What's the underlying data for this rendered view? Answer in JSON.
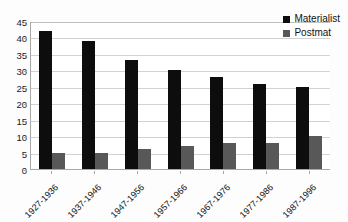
{
  "chart_data": {
    "type": "bar",
    "title": "",
    "xlabel": "",
    "ylabel": "",
    "categories": [
      "1927-1936",
      "1937-1946",
      "1947-1956",
      "1957-1966",
      "1967-1976",
      "1977-1986",
      "1987-1996"
    ],
    "series": [
      {
        "name": "Materialist",
        "color": "#0d0d0d",
        "values": [
          42,
          39,
          33,
          30,
          28,
          26,
          25
        ]
      },
      {
        "name": "Postmat",
        "color": "#585858",
        "values": [
          5,
          5,
          6,
          7,
          8,
          8,
          10
        ]
      }
    ],
    "ylim": [
      0,
      45
    ],
    "ytick_labels": [
      "45",
      "40",
      "35",
      "30",
      "25",
      "20",
      "15",
      "10",
      "5",
      "0"
    ],
    "ytick_values": [
      45,
      40,
      35,
      30,
      25,
      20,
      15,
      10,
      5,
      0
    ],
    "grid": true,
    "legend_position": "top-right"
  },
  "legend": {
    "items": [
      {
        "label": "Materialist"
      },
      {
        "label": "Postmat"
      }
    ]
  }
}
